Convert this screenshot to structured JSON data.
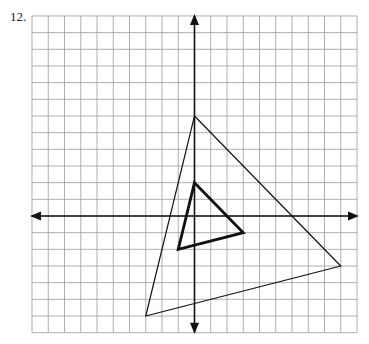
{
  "problem": {
    "number": "12."
  },
  "grid": {
    "x_min": -10,
    "x_max": 10,
    "y_min": -7,
    "y_max": 12,
    "origin_px": [
      194.5,
      216
    ],
    "cell_w": 16.25,
    "cell_h": 16.67,
    "line_color": "#9a9a9a"
  },
  "axes": {
    "color": "#111111"
  },
  "shapes": [
    {
      "name": "large-triangle",
      "vertices": [
        [
          0,
          6
        ],
        [
          9,
          -3
        ],
        [
          -3,
          -6
        ]
      ],
      "stroke": "#111111",
      "stroke_width": 1.2
    },
    {
      "name": "small-triangle",
      "vertices": [
        [
          0,
          2
        ],
        [
          3,
          -1
        ],
        [
          -1,
          -2
        ]
      ],
      "stroke": "#111111",
      "stroke_width": 2.8
    }
  ]
}
